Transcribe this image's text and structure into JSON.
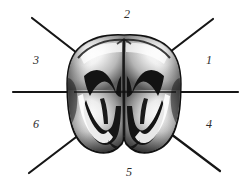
{
  "figure": {
    "background_color": "#ffffff",
    "line_color": "#161616",
    "label_color": "#2b2b2b",
    "labels": [
      {
        "id": "1",
        "text": "1",
        "position": "right"
      },
      {
        "id": "2",
        "text": "2",
        "position": "top"
      },
      {
        "id": "3",
        "text": "3",
        "position": "upper-left"
      },
      {
        "id": "4",
        "text": "4",
        "position": "lower-right"
      },
      {
        "id": "5",
        "text": "5",
        "position": "bottom"
      },
      {
        "id": "6",
        "text": "6",
        "position": "lower-left"
      }
    ],
    "leader_lines": [
      {
        "id": "horizontal-left",
        "x1": 13,
        "y1": 92,
        "x2": 78,
        "y2": 92
      },
      {
        "id": "horizontal-right",
        "x1": 172,
        "y1": 92,
        "x2": 238,
        "y2": 92
      },
      {
        "id": "diagonal-upper-left",
        "x1": 32,
        "y1": 18,
        "x2": 80,
        "y2": 56
      },
      {
        "id": "diagonal-upper-right",
        "x1": 213,
        "y1": 19,
        "x2": 172,
        "y2": 51
      },
      {
        "id": "diagonal-lower-left",
        "x1": 29,
        "y1": 173,
        "x2": 82,
        "y2": 132
      },
      {
        "id": "diagonal-lower-right",
        "x1": 220,
        "y1": 171,
        "x2": 169,
        "y2": 132
      }
    ],
    "tooth": {
      "name": "molar-crown",
      "view": "occlusal",
      "bounds": {
        "left": 70,
        "top": 36,
        "right": 180,
        "bottom": 153
      },
      "features": [
        "central-developmental-groove",
        "mesial-cusp-ridge",
        "distal-cusp-ridge",
        "buccal-lobe-left",
        "buccal-lobe-right",
        "w-shaped-fissure-mesial",
        "w-shaped-fissure-distal"
      ]
    }
  }
}
